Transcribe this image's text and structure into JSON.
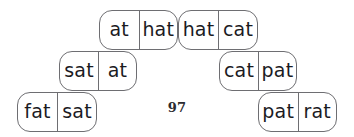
{
  "page": {
    "page_number": "97",
    "background_color": "#ffffff",
    "tile_border_color": "#6e6e72",
    "text_color": "#1b1b1f"
  },
  "dominoes": [
    {
      "id": "tile-0",
      "row": 1,
      "left_label": "at",
      "right_label": "hat"
    },
    {
      "id": "tile-1",
      "row": 1,
      "left_label": "hat",
      "right_label": "cat"
    },
    {
      "id": "tile-2",
      "row": 2,
      "left_label": "sat",
      "right_label": "at"
    },
    {
      "id": "tile-3",
      "row": 2,
      "left_label": "cat",
      "right_label": "pat"
    },
    {
      "id": "tile-4",
      "row": 3,
      "left_label": "fat",
      "right_label": "sat"
    },
    {
      "id": "tile-5",
      "row": 3,
      "left_label": "pat",
      "right_label": "rat"
    }
  ]
}
